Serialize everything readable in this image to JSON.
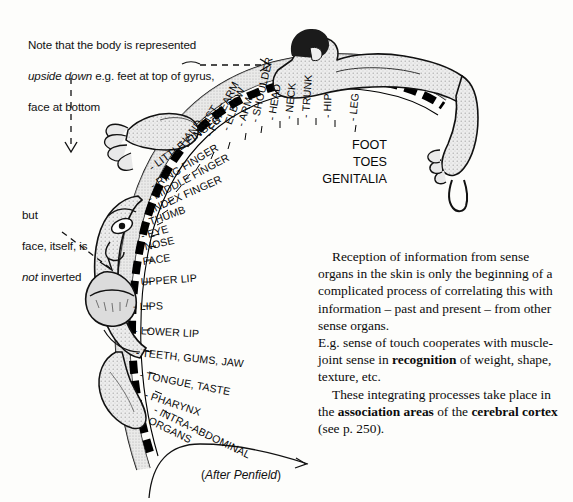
{
  "figure": {
    "caption": "(After Penfield)",
    "caption_open": "(",
    "caption_text": "After Penfield",
    "caption_close": ")"
  },
  "notes": {
    "top": "Note that the body is represented\nupside down e.g. feet at top of gyrus,\nface at bottom",
    "top_line1": "Note that the body is represented",
    "top_line2_italic": "upside down",
    "top_line2_rest": " e.g. feet at top of gyrus,",
    "top_line3": "face at bottom",
    "left_line1": "but",
    "left_line2": "face, itself, is",
    "left_line3_italic": "not",
    "left_line3_rest": " inverted"
  },
  "arc_labels": [
    {
      "text": "LITTLE FINGER",
      "x": 150,
      "y": 168,
      "rot": -36
    },
    {
      "text": "RING FINGER",
      "x": 151,
      "y": 186,
      "rot": -31
    },
    {
      "text": "MIDDLE FINGER",
      "x": 148,
      "y": 199,
      "rot": -28
    },
    {
      "text": "INDEX FINGER",
      "x": 145,
      "y": 212,
      "rot": -24
    },
    {
      "text": "THUMB",
      "x": 143,
      "y": 224,
      "rot": -20
    },
    {
      "text": "EYE",
      "x": 141,
      "y": 236,
      "rot": -16
    },
    {
      "text": "NOSE",
      "x": 138,
      "y": 248,
      "rot": -13
    },
    {
      "text": "FACE",
      "x": 136,
      "y": 262,
      "rot": -8
    },
    {
      "text": "UPPER LIP",
      "x": 134,
      "y": 282,
      "rot": -4
    },
    {
      "text": "LIPS",
      "x": 133,
      "y": 306,
      "rot": -1
    },
    {
      "text": "LOWER LIP",
      "x": 134,
      "y": 330,
      "rot": 3
    },
    {
      "text": "TEETH, GUMS, JAW",
      "x": 136,
      "y": 352,
      "rot": 6
    },
    {
      "text": "TONGUE, TASTE",
      "x": 140,
      "y": 374,
      "rot": 11
    },
    {
      "text": "PHARYNX",
      "x": 145,
      "y": 394,
      "rot": 18
    },
    {
      "text": "INTRA-ABDOMINAL\nORGANS",
      "x": 152,
      "y": 414,
      "rot": 26
    }
  ],
  "arc_labels_upper": [
    {
      "text": "HAND",
      "x": 177,
      "y": 150,
      "rot": -52
    },
    {
      "text": "WRIST",
      "x": 193,
      "y": 141,
      "rot": -58
    },
    {
      "text": "FOREARM",
      "x": 208,
      "y": 136,
      "rot": -63
    },
    {
      "text": "ELBOW",
      "x": 225,
      "y": 130,
      "rot": -69
    },
    {
      "text": "ARM",
      "x": 240,
      "y": 126,
      "rot": -73
    },
    {
      "text": "SHOULDER",
      "x": 254,
      "y": 122,
      "rot": -77
    },
    {
      "text": "HEAD",
      "x": 271,
      "y": 120,
      "rot": -81
    },
    {
      "text": "NECK",
      "x": 288,
      "y": 119,
      "rot": -84
    },
    {
      "text": "TRUNK",
      "x": 305,
      "y": 118,
      "rot": -86
    },
    {
      "text": "HIP",
      "x": 327,
      "y": 118,
      "rot": -89
    },
    {
      "text": "LEG",
      "x": 352,
      "y": 121,
      "rot": -84
    }
  ],
  "flat_labels": [
    {
      "text": "FOOT",
      "x": 329,
      "y": 138,
      "w": 58
    },
    {
      "text": "TOES",
      "x": 327,
      "y": 155,
      "w": 60
    },
    {
      "text": "GENITALIA",
      "x": 301,
      "y": 172,
      "w": 86
    }
  ],
  "body_text": {
    "para1_indent": "Reception of information from sense organs in the skin is only the beginning of a complicated process of correlating this with information – past and present – from other sense organs.",
    "para2_a": "E.g. sense of touch cooperates with muscle-joint sense in ",
    "para2_bold": "recognition",
    "para2_b": " of weight, shape, texture, etc.",
    "para3_a": "These integrating processes take place in the ",
    "para3_bold1": "association areas",
    "para3_b": " of the ",
    "para3_bold2": "cerebral cortex",
    "para3_c": " (see p. 250)."
  },
  "colors": {
    "ink": "#000000",
    "paper": "#fdfdfb",
    "shade_light": "#d8d8d8",
    "shade_mid": "#b4b4b4",
    "shade_dark": "#6e6e6e"
  },
  "icons": {
    "arrow_horizontal": "dashed-arrow-right-icon",
    "arrow_vertical": "dashed-arrow-down-icon",
    "arrow_diagonal": "dashed-arrow-diagonal-icon",
    "pointer_caption": "caption-pointer-icon"
  }
}
